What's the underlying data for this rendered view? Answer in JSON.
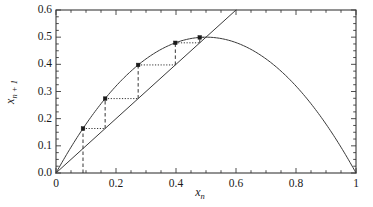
{
  "chart_data": {
    "type": "line",
    "title": "",
    "subtitle": "",
    "xlabel": "x_n",
    "ylabel": "x_{n+1}",
    "xlim": [
      0,
      1
    ],
    "ylim": [
      0.0,
      0.6
    ],
    "grid": false,
    "legend": null,
    "background_color": "#ffffff",
    "line_color": "#3a3a3a",
    "marker_color": "#1a1a1a",
    "xticks": [
      0,
      0.2,
      0.4,
      0.6,
      0.8,
      1
    ],
    "xtick_labels": [
      "0",
      "0.2",
      "0.4",
      "0.6",
      "0.8",
      "1"
    ],
    "yticks": [
      0.0,
      0.1,
      0.2,
      0.3,
      0.4,
      0.5,
      0.6
    ],
    "ytick_labels": [
      "0.0",
      "0.1",
      "0.2",
      "0.3",
      "0.4",
      "0.5",
      "0.6"
    ],
    "x_minor_tick_step": 0.05,
    "y_minor_tick_step": 0.025,
    "series": [
      {
        "name": "logistic-map-parabola",
        "type": "curve",
        "equation": "y = 2x(1-x)",
        "style": "solid",
        "points": [
          [
            0.0,
            0.0
          ],
          [
            0.05,
            0.095
          ],
          [
            0.1,
            0.18
          ],
          [
            0.15,
            0.255
          ],
          [
            0.2,
            0.32
          ],
          [
            0.25,
            0.375
          ],
          [
            0.3,
            0.42
          ],
          [
            0.35,
            0.455
          ],
          [
            0.4,
            0.48
          ],
          [
            0.45,
            0.495
          ],
          [
            0.5,
            0.5
          ],
          [
            0.55,
            0.495
          ],
          [
            0.6,
            0.48
          ],
          [
            0.65,
            0.455
          ],
          [
            0.7,
            0.42
          ],
          [
            0.75,
            0.375
          ],
          [
            0.8,
            0.32
          ],
          [
            0.85,
            0.255
          ],
          [
            0.9,
            0.18
          ],
          [
            0.95,
            0.095
          ],
          [
            1.0,
            0.0
          ]
        ]
      },
      {
        "name": "identity-diagonal",
        "type": "line",
        "equation": "y = x",
        "style": "solid",
        "points": [
          [
            0.0,
            0.0
          ],
          [
            0.6,
            0.6
          ]
        ]
      }
    ],
    "cobweb": {
      "name": "cobweb-iteration",
      "vertical_style": "dashed",
      "horizontal_style": "dotted",
      "start_x": 0.09,
      "fixed_point": [
        0.5,
        0.5
      ],
      "iterates": [
        0.09,
        0.1638,
        0.2739,
        0.3978,
        0.4792,
        0.4991
      ],
      "segments": [
        {
          "type": "vertical",
          "x": 0.09,
          "y0": 0.0,
          "y1": 0.1638
        },
        {
          "type": "horizontal",
          "y": 0.1638,
          "x0": 0.09,
          "x1": 0.1638
        },
        {
          "type": "vertical",
          "x": 0.1638,
          "y0": 0.1638,
          "y1": 0.2739
        },
        {
          "type": "horizontal",
          "y": 0.2739,
          "x0": 0.1638,
          "x1": 0.2739
        },
        {
          "type": "vertical",
          "x": 0.2739,
          "y0": 0.2739,
          "y1": 0.3978
        },
        {
          "type": "horizontal",
          "y": 0.3978,
          "x0": 0.2739,
          "x1": 0.3978
        },
        {
          "type": "vertical",
          "x": 0.3978,
          "y0": 0.3978,
          "y1": 0.4792
        },
        {
          "type": "horizontal",
          "y": 0.4792,
          "x0": 0.3978,
          "x1": 0.4792
        },
        {
          "type": "vertical",
          "x": 0.4792,
          "y0": 0.4792,
          "y1": 0.4991
        },
        {
          "type": "horizontal",
          "y": 0.4991,
          "x0": 0.4792,
          "x1": 0.4991
        }
      ],
      "markers": [
        [
          0.09,
          0.1638
        ],
        [
          0.1638,
          0.2739
        ],
        [
          0.2739,
          0.3978
        ],
        [
          0.3978,
          0.4792
        ],
        [
          0.4792,
          0.4991
        ]
      ]
    }
  },
  "axes": {
    "x_title_base": "x",
    "x_title_sub": "n",
    "y_title_base": "x",
    "y_title_sub": "n + 1"
  }
}
